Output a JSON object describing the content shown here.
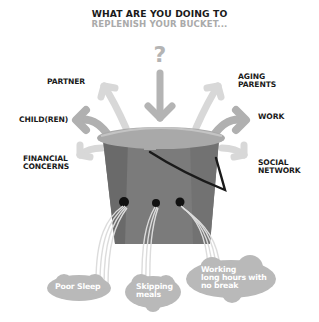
{
  "header": {
    "title": "WHAT ARE YOU DOING TO",
    "subtitle": "REPLENISH YOUR BUCKET..."
  },
  "center_symbol": "?",
  "left_labels": [
    {
      "id": "partner",
      "lines": [
        "PARTNER"
      ]
    },
    {
      "id": "children",
      "lines": [
        "CHILD(REN)"
      ]
    },
    {
      "id": "financial",
      "lines": [
        "FINANCIAL",
        "CONCERNS"
      ]
    }
  ],
  "right_labels": [
    {
      "id": "aging-parents",
      "lines": [
        "AGING",
        "PARENTS"
      ]
    },
    {
      "id": "work",
      "lines": [
        "WORK"
      ]
    },
    {
      "id": "social-network",
      "lines": [
        "SOCIAL",
        "NETWORK"
      ]
    }
  ],
  "drains": [
    {
      "id": "poor-sleep",
      "lines": [
        "Poor Sleep"
      ]
    },
    {
      "id": "skipping-meals",
      "lines": [
        "Skipping",
        "meals"
      ]
    },
    {
      "id": "working-long-hours",
      "lines": [
        "Working",
        "long hours with",
        "no break"
      ]
    }
  ],
  "colors": {
    "bucket": "#7b7b7b",
    "bucket_dark": "#6a6a6a",
    "rim": "#a9a9a9",
    "arrow": "#b4b4b4",
    "arrow_light": "#d8d8d8",
    "cloud": "#b9b9b9",
    "text_dark": "#1a1a1a",
    "text_gray": "#aaaaaa"
  }
}
